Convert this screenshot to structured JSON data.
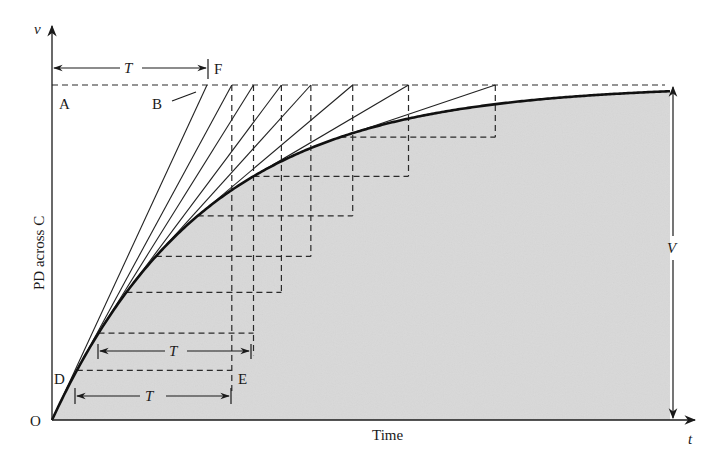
{
  "diagram": {
    "axes": {
      "y_axis_symbol": "v",
      "y_axis_label": "PD across C",
      "x_axis_symbol": "t",
      "x_axis_label": "Time",
      "origin_label": "O"
    },
    "points": {
      "A": "A",
      "B": "B",
      "D": "D",
      "E": "E",
      "F": "F"
    },
    "dimensions": {
      "top_interval": "T",
      "middle_interval": "T",
      "bottom_interval": "T",
      "final_voltage": "V"
    },
    "colors": {
      "shade": "#d9d9d9",
      "ink": "#1a1a1a",
      "background": "#ffffff"
    },
    "curve": {
      "type": "exponential-rise",
      "equation": "v = V(1 - e^(-t/T))",
      "tangent_count": 8,
      "tangent_points_t_over_T": [
        0,
        0.16,
        0.3,
        0.48,
        0.67,
        0.94,
        1.3,
        1.86
      ]
    }
  }
}
